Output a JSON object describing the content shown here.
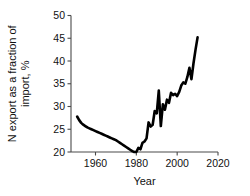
{
  "chart_data": {
    "type": "line",
    "title": "",
    "xlabel": "Year",
    "ylabel": "N export as a fraction of import, %",
    "ylabel_line1": "N export as a fraction of",
    "ylabel_line2": "import, %",
    "xlim": [
      1948,
      2020
    ],
    "ylim": [
      20,
      50
    ],
    "xticks": [
      1960,
      1980,
      2000,
      2020
    ],
    "xticklabels": [
      "1960",
      "1980",
      "2000",
      "2020"
    ],
    "yticks": [
      20,
      25,
      30,
      35,
      40,
      45,
      50
    ],
    "yticklabels": [
      "20",
      "25",
      "30",
      "35",
      "40",
      "45",
      "50"
    ],
    "grid": false,
    "legend": false,
    "series": [
      {
        "name": "N export as a fraction of import",
        "color": "#000000",
        "x": [
          1951,
          1952,
          1953,
          1954,
          1955,
          1956,
          1957,
          1958,
          1959,
          1960,
          1961,
          1962,
          1963,
          1964,
          1965,
          1966,
          1967,
          1968,
          1969,
          1970,
          1971,
          1972,
          1973,
          1974,
          1975,
          1976,
          1977,
          1978,
          1979,
          1980,
          1981,
          1982,
          1983,
          1984,
          1985,
          1986,
          1987,
          1988,
          1989,
          1990,
          1991,
          1992,
          1993,
          1994,
          1995,
          1996,
          1997,
          1998,
          1999,
          2000,
          2001,
          2002,
          2003,
          2004,
          2005,
          2006,
          2007,
          2008,
          2009,
          2010
        ],
        "y": [
          27.8,
          27.0,
          26.4,
          26.0,
          25.7,
          25.4,
          25.2,
          25.0,
          24.8,
          24.6,
          24.4,
          24.2,
          24.0,
          23.8,
          23.6,
          23.4,
          23.2,
          23.0,
          22.8,
          22.6,
          22.3,
          22.0,
          21.7,
          21.4,
          21.1,
          20.8,
          20.5,
          20.2,
          20.0,
          20.0,
          20.9,
          20.6,
          22.0,
          22.3,
          23.0,
          26.5,
          25.6,
          26.0,
          29.0,
          28.5,
          33.5,
          25.7,
          30.5,
          29.3,
          31.5,
          30.8,
          33.0,
          32.5,
          32.8,
          32.3,
          33.2,
          34.6,
          35.3,
          35.0,
          36.5,
          38.5,
          36.0,
          39.5,
          42.5,
          45.2
        ]
      }
    ]
  }
}
